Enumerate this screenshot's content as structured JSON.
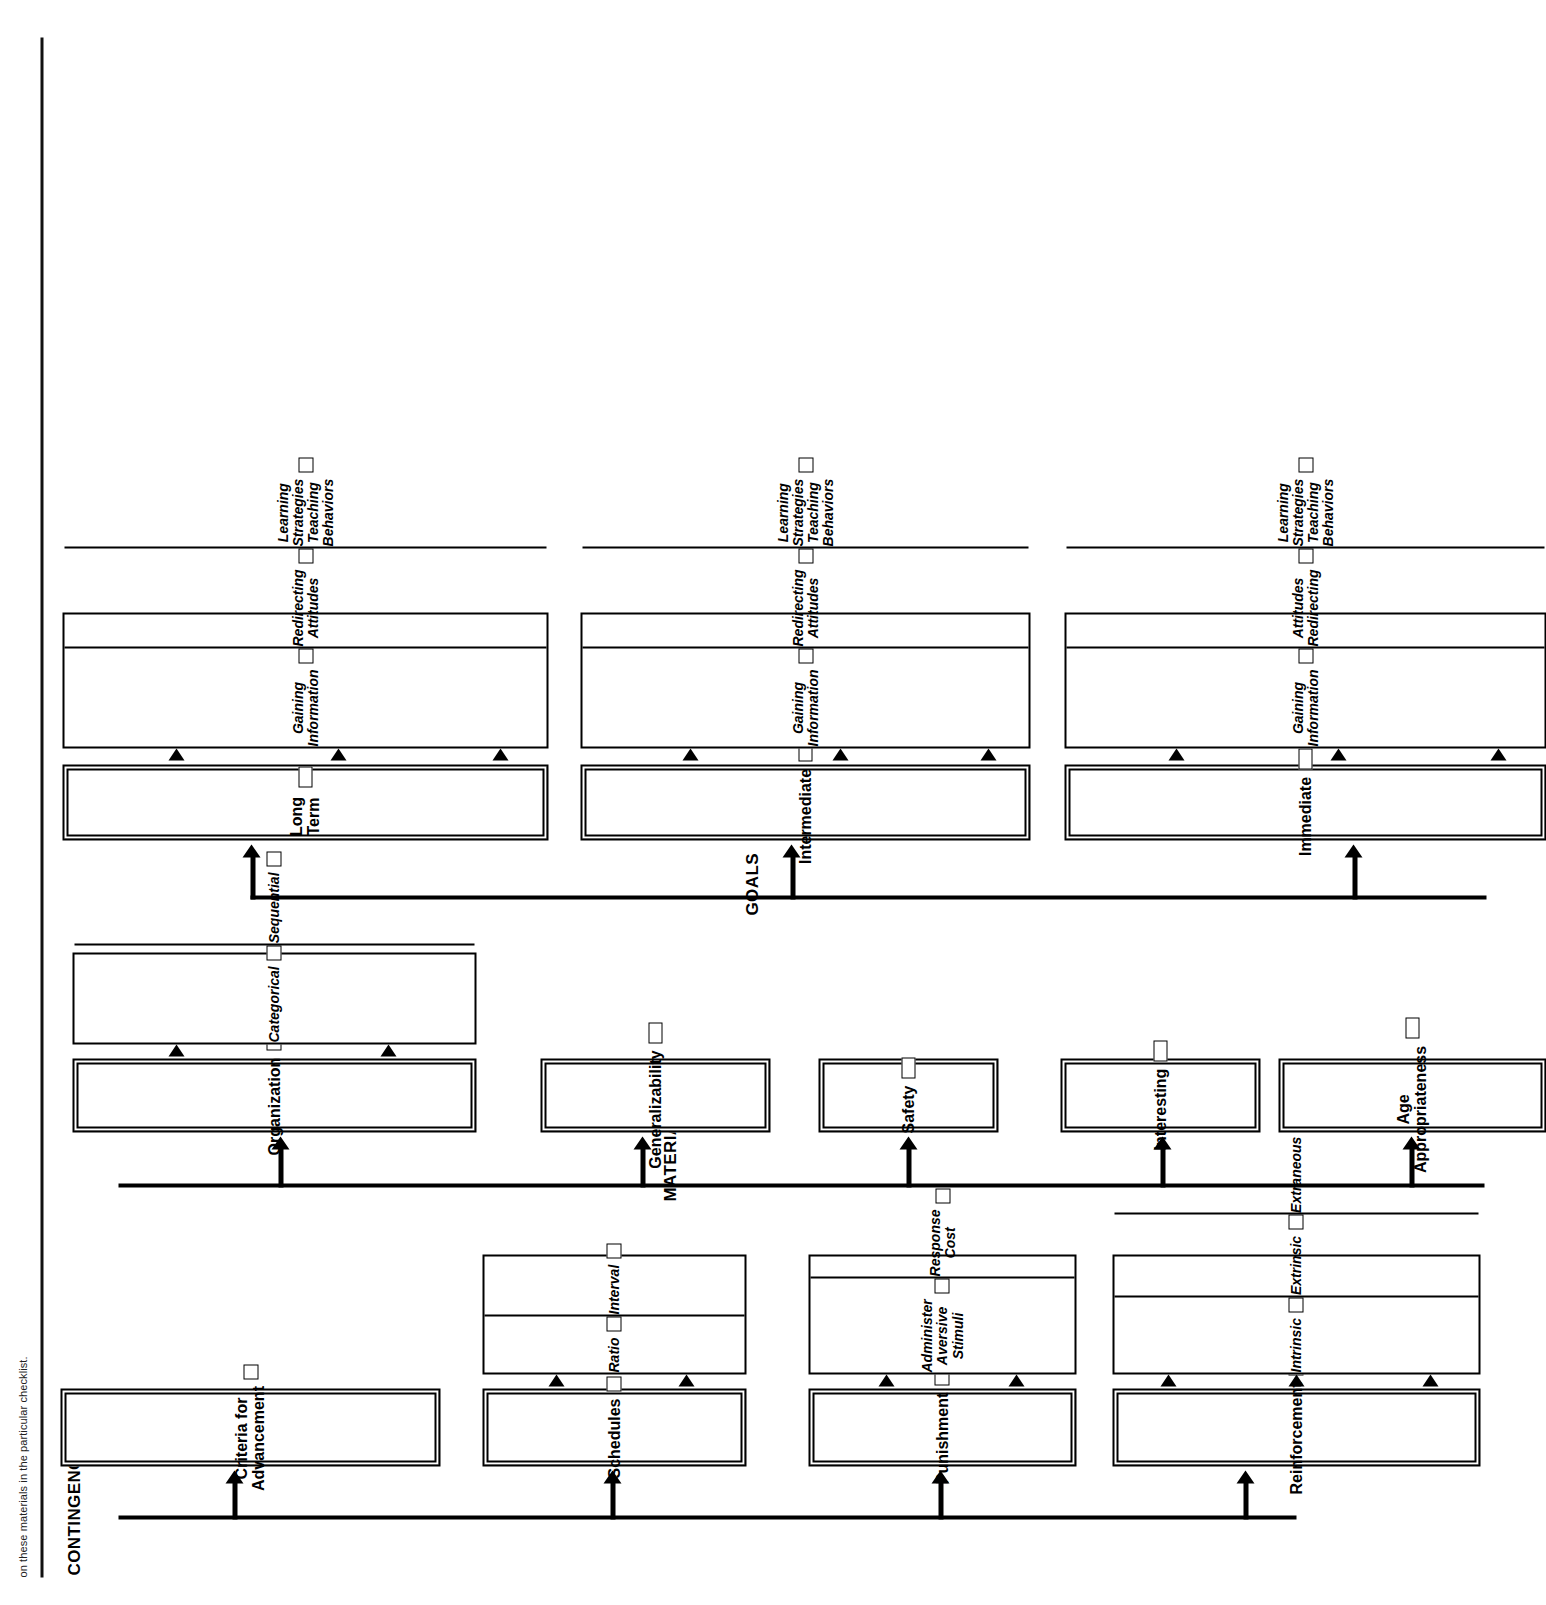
{
  "caption": "on these materials in the particular checklist.",
  "sections": [
    {
      "id": "contingencies",
      "label": "CONTINGENCIES",
      "nodes": [
        {
          "label": "Reinforcement",
          "checkbox": true,
          "children": [
            {
              "label": "Intrinsic",
              "checkbox": true
            },
            {
              "label": "Extrinsic",
              "checkbox": true
            },
            {
              "label": "Extraneous",
              "checkbox": true
            }
          ]
        },
        {
          "label": "Punishment",
          "checkbox": true,
          "children": [
            {
              "label": "Administer\nAversive\nStimuli",
              "checkbox": true
            },
            {
              "label": "Response\nCost",
              "checkbox": true
            }
          ]
        },
        {
          "label": "Schedules",
          "checkbox": true,
          "children": [
            {
              "label": "Ratio",
              "checkbox": true
            },
            {
              "label": "Interval",
              "checkbox": true
            }
          ]
        },
        {
          "label": "Criteria for Advancement",
          "checkbox": true,
          "children": []
        }
      ]
    },
    {
      "id": "materials",
      "label": "MATERIALS",
      "nodes": [
        {
          "label": "Age Appropriateness",
          "checkbox": true,
          "children": []
        },
        {
          "label": "Interesting",
          "checkbox": true,
          "children": []
        },
        {
          "label": "Safety",
          "checkbox": true,
          "children": []
        },
        {
          "label": "Generalizability",
          "checkbox": true,
          "children": []
        },
        {
          "label": "Organization",
          "checkbox": true,
          "children": [
            {
              "label": "Categorical",
              "checkbox": true
            },
            {
              "label": "Sequential",
              "checkbox": true
            }
          ]
        }
      ]
    },
    {
      "id": "goals",
      "label": "GOALS",
      "nodes": [
        {
          "label": "Immediate",
          "checkbox": true,
          "children": [
            {
              "label": "Gaining\nInformation",
              "checkbox": true
            },
            {
              "label": "Attitudes\nRedirecting",
              "checkbox": true
            },
            {
              "label": "Learning\nStrategies\nTeaching\nBehaviors",
              "checkbox": true
            }
          ]
        },
        {
          "label": "Intermediate",
          "checkbox": true,
          "children": [
            {
              "label": "Gaining\nInformation",
              "checkbox": true
            },
            {
              "label": "Redirecting\nAttitudes",
              "checkbox": true
            },
            {
              "label": "Learning\nStrategies\nTeaching\nBehaviors",
              "checkbox": true
            }
          ]
        },
        {
          "label": "Long Term",
          "checkbox": true,
          "children": [
            {
              "label": "Gaining\nInformation",
              "checkbox": true
            },
            {
              "label": "Redirecting\nAttitudes",
              "checkbox": true
            },
            {
              "label": "Learning\nStrategies\nTeaching\nBehaviors",
              "checkbox": true
            }
          ]
        }
      ]
    }
  ],
  "colors": {
    "ink": "#000000",
    "paper": "#ffffff"
  }
}
